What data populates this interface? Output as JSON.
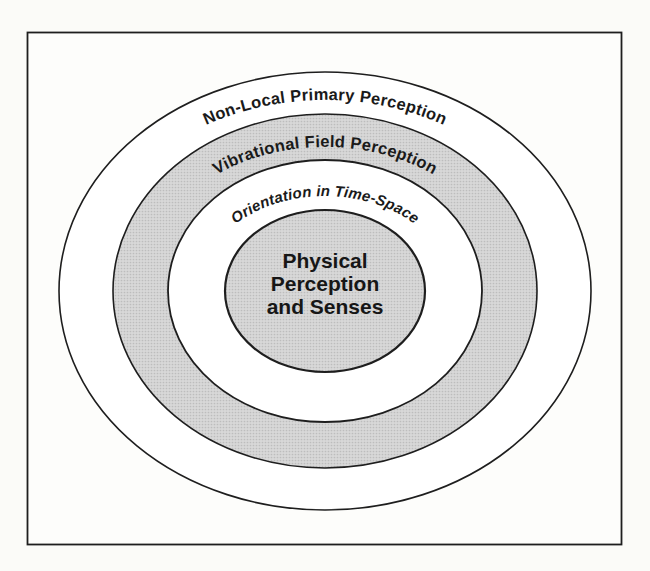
{
  "figure": {
    "type": "concentric-rings-diagram",
    "rings": [
      {
        "label": "Non-Local Primary Perception",
        "shaded": false
      },
      {
        "label": "Vibrational Field Perception",
        "shaded": true
      },
      {
        "label": "Orientation in Time-Space",
        "shaded": false
      },
      {
        "label": "Physical Perception and Senses",
        "shaded": true
      }
    ],
    "center_label_lines": [
      "Physical",
      "Perception",
      "and Senses"
    ],
    "colors": {
      "stroke": "#1e1e1e",
      "shade_base": "#d8d8d8",
      "shade_dot": "#bdbdbd",
      "paper": "#fdfdfb",
      "text": "#1a1a1a"
    }
  }
}
